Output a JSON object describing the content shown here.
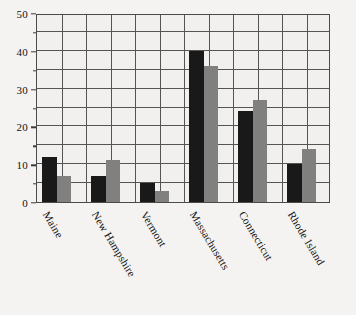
{
  "chart_data": {
    "type": "bar",
    "title": "",
    "subtitle": "",
    "xlabel": "",
    "ylabel": "",
    "categories": [
      "Maine",
      "New Hampshire",
      "Vermont",
      "Massachusetts",
      "Connecticut",
      "Rhode Island"
    ],
    "series": [
      {
        "name": "series-1",
        "color": "#19191a",
        "values": [
          12,
          7,
          5,
          40,
          24,
          10
        ]
      },
      {
        "name": "series-2",
        "color": "#80807e",
        "values": [
          7,
          11,
          3,
          36,
          27,
          14
        ]
      }
    ],
    "ylim": [
      0,
      50
    ],
    "y_ticks": [
      0,
      10,
      20,
      30,
      40,
      50
    ],
    "y_tick_labels": [
      "0",
      "10",
      "20",
      "30",
      "40",
      "50"
    ],
    "y_minor_ticks": [
      5,
      15,
      25,
      35,
      45
    ],
    "grid": true,
    "grid_vertical": true,
    "legend": "none",
    "x_label_rotation": 59,
    "background_color": "#f4f3f1",
    "plot_background_color": "#f1f0ee",
    "grid_color": "#555452",
    "frame_color": "#4a4a4a"
  }
}
